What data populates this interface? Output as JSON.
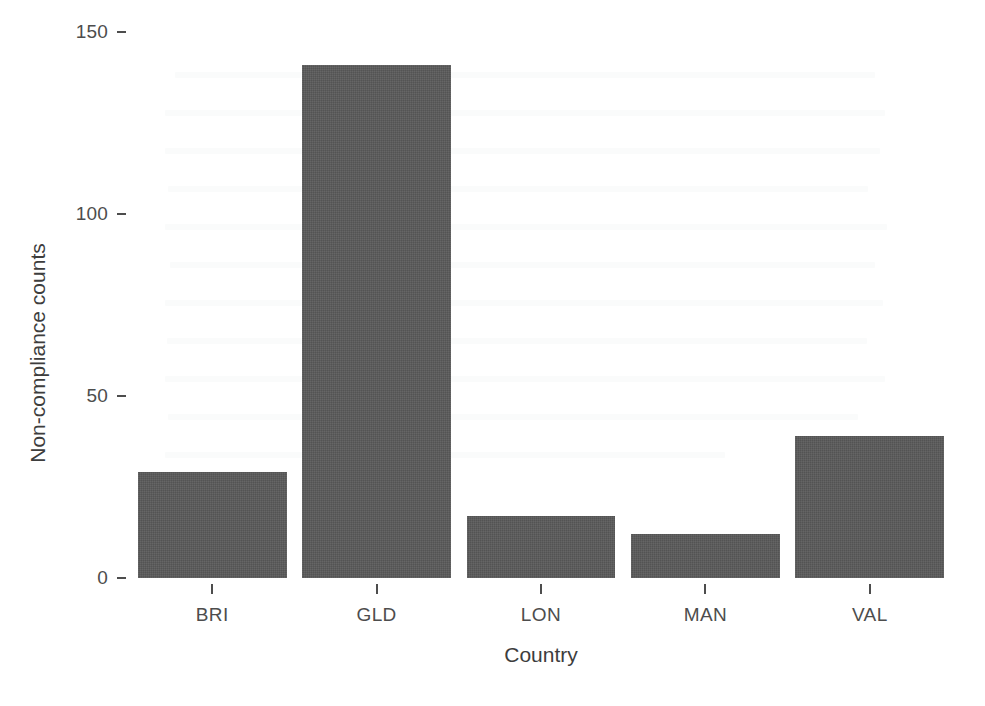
{
  "chart_data": {
    "type": "bar",
    "title": "",
    "subtitle": "",
    "xlabel": "Country",
    "ylabel": "Non-compliance counts",
    "categories": [
      "BRI",
      "GLD",
      "LON",
      "MAN",
      "VAL"
    ],
    "values": [
      29,
      141,
      17,
      12,
      39
    ],
    "series": [
      {
        "name": "Non-compliance counts",
        "values": [
          29,
          141,
          17,
          12,
          39
        ]
      }
    ],
    "ylim": [
      0,
      150
    ],
    "yticks": [
      0,
      50,
      100,
      150
    ],
    "ytick_labels": [
      "0",
      "50",
      "100",
      "150"
    ],
    "grid": false,
    "legend": false,
    "legend_position": "none",
    "bar_color": "#595959",
    "axis_color": "#4d4d4d",
    "background_color": "#ffffff",
    "annotations": []
  },
  "figure": {
    "background_color": "#ffffff",
    "text_color": "#4d4d4d"
  }
}
